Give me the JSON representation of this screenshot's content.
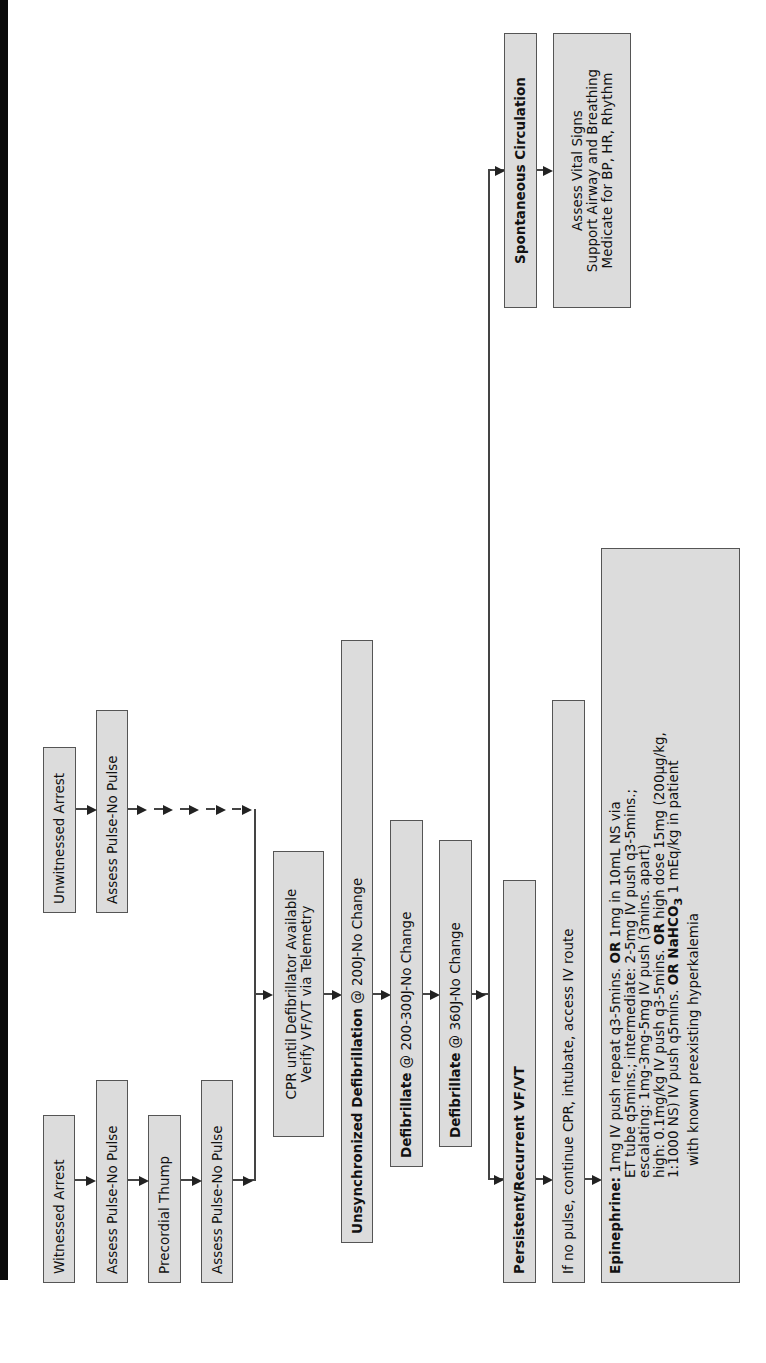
{
  "flowchart": {
    "orientation": "rotated -90deg (reads bottom-to-top)",
    "witnessed_path": {
      "witnessed_arrest": "Witnessed Arrest",
      "assess_pulse_1": "Assess Pulse-No Pulse",
      "precordial_thump": "Precordial Thump",
      "assess_pulse_2": "Assess Pulse-No Pulse"
    },
    "unwitnessed_path": {
      "unwitnessed_arrest": "Unwitnessed Arrest",
      "assess_pulse_3": "Assess Pulse-No Pulse"
    },
    "cpr": {
      "line1": "CPR until Defibrillator Available",
      "line2": "Verify VF/VT via Telemetry"
    },
    "unsync": {
      "prefix": "Unsynchronized ",
      "bold": "Defibrillation",
      "suffix": " @ 200J-No Change"
    },
    "defib2": {
      "bold": "Defibrillate",
      "suffix": " @ 200-300J-No Change"
    },
    "defib3": {
      "bold": "Defibrillate",
      "suffix": " @ 360J-No Change"
    },
    "persistent": "Persistent/Recurrent VF/VT",
    "no_pulse": "If no pulse, continue CPR, intubate, access IV route",
    "epinephrine": {
      "label": "Epinephrine:",
      "l1a": " 1mg IV push repeat q3-5mins. ",
      "l1or": "OR",
      "l1b": " 1mg in 10mL NS via",
      "l2": "ET tube q5mins.; intermediate: 2-5mg IV push q3-5mins.;",
      "l3": "escalating: 1mg-3mg-5mg IV push (3mins. apart)",
      "l4a": "high: 0.1mg/kg IV push q3-5mins. ",
      "l4or": "OR",
      "l4b": " high dose 15mg (200µg/kg,",
      "l5a": "1:1000 NS) IV push q5mins. ",
      "l5or": "OR NaHCO",
      "l5sub": "3",
      "l5b": " 1 mEq/kg in patient",
      "l6": "with known preexisting hyperkalemia"
    },
    "spontaneous": "Spontaneous Circulation",
    "vitals": {
      "line1": "Assess Vital Signs",
      "line2": "Support Airway and Breathing",
      "line3": "Medicate for BP, HR, Rhythm"
    },
    "colors": {
      "box_fill": "#dcdcdc",
      "box_border": "#555555",
      "line": "#444444",
      "left_bar": "#0a0a0a"
    }
  }
}
